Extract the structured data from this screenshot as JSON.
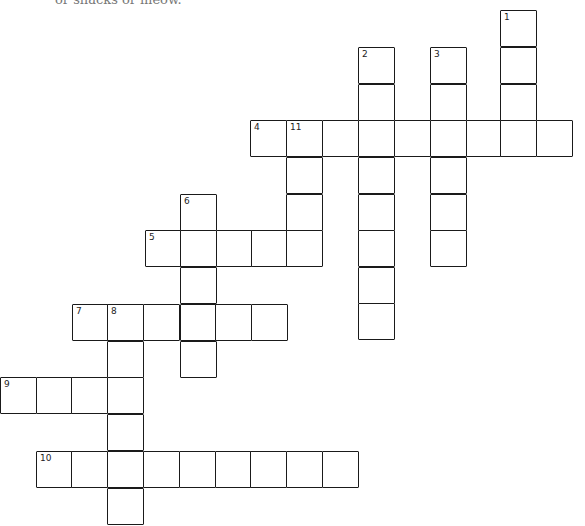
{
  "header": {
    "fragment_text": "or snacks or meow."
  },
  "crossword": {
    "cell_size": 36,
    "clues": [
      {
        "number": "1",
        "direction": "down",
        "length": 4
      },
      {
        "number": "2",
        "direction": "down",
        "length": 8
      },
      {
        "number": "3",
        "direction": "down",
        "length": 6
      },
      {
        "number": "4",
        "direction": "across",
        "length": 9
      },
      {
        "number": "5",
        "direction": "across",
        "length": 5
      },
      {
        "number": "6",
        "direction": "down",
        "length": 5
      },
      {
        "number": "7",
        "direction": "across",
        "length": 6
      },
      {
        "number": "8",
        "direction": "down",
        "length": 5
      },
      {
        "number": "9",
        "direction": "across",
        "length": 4
      },
      {
        "number": "10",
        "direction": "across",
        "length": 9
      },
      {
        "number": "11",
        "direction": "down",
        "length": 4
      }
    ],
    "cells": [
      {
        "x": 500,
        "y": 10,
        "n": "1"
      },
      {
        "x": 500,
        "y": 47,
        "n": ""
      },
      {
        "x": 500,
        "y": 84,
        "n": ""
      },
      {
        "x": 358,
        "y": 47,
        "n": "2"
      },
      {
        "x": 358,
        "y": 84,
        "n": ""
      },
      {
        "x": 358,
        "y": 157,
        "n": ""
      },
      {
        "x": 358,
        "y": 194,
        "n": ""
      },
      {
        "x": 358,
        "y": 230,
        "n": ""
      },
      {
        "x": 358,
        "y": 267,
        "n": ""
      },
      {
        "x": 358,
        "y": 303,
        "n": ""
      },
      {
        "x": 430,
        "y": 47,
        "n": "3"
      },
      {
        "x": 430,
        "y": 84,
        "n": ""
      },
      {
        "x": 430,
        "y": 157,
        "n": ""
      },
      {
        "x": 430,
        "y": 194,
        "n": ""
      },
      {
        "x": 430,
        "y": 230,
        "n": ""
      },
      {
        "x": 250,
        "y": 120,
        "n": "4"
      },
      {
        "x": 286,
        "y": 120,
        "n": "11"
      },
      {
        "x": 322,
        "y": 120,
        "n": ""
      },
      {
        "x": 358,
        "y": 120,
        "n": ""
      },
      {
        "x": 394,
        "y": 120,
        "n": ""
      },
      {
        "x": 430,
        "y": 120,
        "n": ""
      },
      {
        "x": 466,
        "y": 120,
        "n": ""
      },
      {
        "x": 500,
        "y": 120,
        "n": ""
      },
      {
        "x": 536,
        "y": 120,
        "n": ""
      },
      {
        "x": 286,
        "y": 157,
        "n": ""
      },
      {
        "x": 286,
        "y": 194,
        "n": ""
      },
      {
        "x": 180,
        "y": 194,
        "n": "6"
      },
      {
        "x": 145,
        "y": 230,
        "n": "5"
      },
      {
        "x": 180,
        "y": 230,
        "n": ""
      },
      {
        "x": 216,
        "y": 230,
        "n": ""
      },
      {
        "x": 251,
        "y": 230,
        "n": ""
      },
      {
        "x": 286,
        "y": 230,
        "n": ""
      },
      {
        "x": 180,
        "y": 267,
        "n": ""
      },
      {
        "x": 72,
        "y": 304,
        "n": "7"
      },
      {
        "x": 107,
        "y": 304,
        "n": "8"
      },
      {
        "x": 143,
        "y": 304,
        "n": ""
      },
      {
        "x": 180,
        "y": 304,
        "n": ""
      },
      {
        "x": 215,
        "y": 304,
        "n": ""
      },
      {
        "x": 251,
        "y": 304,
        "n": ""
      },
      {
        "x": 180,
        "y": 341,
        "n": ""
      },
      {
        "x": 107,
        "y": 341,
        "n": ""
      },
      {
        "x": 0,
        "y": 377,
        "n": "9"
      },
      {
        "x": 36,
        "y": 377,
        "n": ""
      },
      {
        "x": 71,
        "y": 377,
        "n": ""
      },
      {
        "x": 107,
        "y": 377,
        "n": ""
      },
      {
        "x": 107,
        "y": 414,
        "n": ""
      },
      {
        "x": 36,
        "y": 451,
        "n": "10"
      },
      {
        "x": 71,
        "y": 451,
        "n": ""
      },
      {
        "x": 107,
        "y": 451,
        "n": ""
      },
      {
        "x": 143,
        "y": 451,
        "n": ""
      },
      {
        "x": 179,
        "y": 451,
        "n": ""
      },
      {
        "x": 215,
        "y": 451,
        "n": ""
      },
      {
        "x": 250,
        "y": 451,
        "n": ""
      },
      {
        "x": 286,
        "y": 451,
        "n": ""
      },
      {
        "x": 322,
        "y": 451,
        "n": ""
      },
      {
        "x": 107,
        "y": 488,
        "n": ""
      }
    ]
  }
}
